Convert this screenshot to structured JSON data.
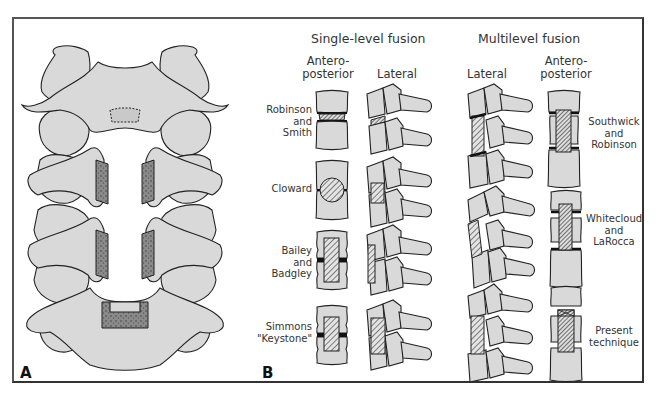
{
  "figure": {
    "panel_a_label": "A",
    "panel_b_label": "B",
    "colors": {
      "frame": "#555555",
      "bone_fill": "#d9d9d9",
      "outline": "#222222",
      "background": "#ffffff"
    }
  },
  "panel_a": {
    "description": "Posterior view of cervical spine showing trough cut through vertebral bodies with keyed slots for strut graft"
  },
  "panel_b": {
    "single_level": {
      "title": "Single-level fusion",
      "columns": [
        "Antero-\nposterior",
        "Lateral"
      ],
      "techniques": [
        {
          "label": "Robinson\nand\nSmith",
          "graft": "horseshoe"
        },
        {
          "label": "Cloward",
          "graft": "dowel"
        },
        {
          "label": "Bailey\nand\nBadgley",
          "graft": "strip"
        },
        {
          "label": "Simmons\n\"Keystone\"",
          "graft": "keystone"
        }
      ]
    },
    "multilevel": {
      "title": "Multilevel fusion",
      "columns": [
        "Lateral",
        "Antero-\nposterior"
      ],
      "techniques": [
        {
          "label": "Southwick\nand\nRobinson"
        },
        {
          "label": "Whitecloud\nand\nLaRocca"
        },
        {
          "label": "Present\ntechnique"
        }
      ]
    }
  }
}
